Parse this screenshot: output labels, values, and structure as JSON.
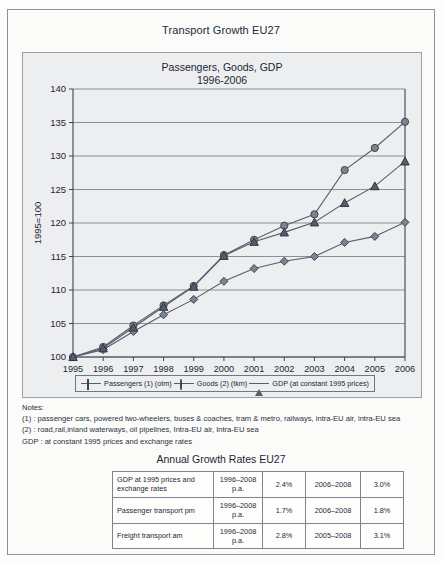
{
  "document": {
    "title": "Transport Growth EU27"
  },
  "chart_panel": {
    "title_line1": "Passengers, Goods, GDP",
    "title_line2": "1996-2006",
    "y_axis_label": "1995=100"
  },
  "chart_data": {
    "type": "line",
    "title": "Passengers, Goods, GDP 1996-2006",
    "xlabel": "",
    "ylabel": "1995=100",
    "ylim": [
      100,
      140
    ],
    "yticks": [
      100,
      105,
      110,
      115,
      120,
      125,
      130,
      135,
      140
    ],
    "grid": true,
    "legend_position": "bottom",
    "x": [
      1995,
      1996,
      1997,
      1998,
      1999,
      2000,
      2001,
      2002,
      2003,
      2004,
      2005,
      2006
    ],
    "categories": [
      "1995",
      "1996",
      "1997",
      "1998",
      "1999",
      "2000",
      "2001",
      "2002",
      "2003",
      "2004",
      "2005",
      "2006"
    ],
    "series": [
      {
        "name": "Passengers (1) (otm)",
        "marker": "diamond",
        "values": [
          100.0,
          101.1,
          103.8,
          106.3,
          108.6,
          111.3,
          113.2,
          114.3,
          115.0,
          117.1,
          118.0,
          120.1
        ]
      },
      {
        "name": "Goods (2) (tkm)",
        "marker": "circle",
        "values": [
          100.0,
          101.5,
          104.7,
          107.7,
          110.6,
          115.2,
          117.5,
          119.6,
          121.3,
          127.9,
          131.2,
          135.1
        ]
      },
      {
        "name": "GDP (at constant 1995 prices)",
        "marker": "triangle",
        "values": [
          100.0,
          101.3,
          104.4,
          107.5,
          110.5,
          115.1,
          117.2,
          118.6,
          120.1,
          123.0,
          125.5,
          129.2
        ]
      }
    ]
  },
  "legend": {
    "items": [
      {
        "label": "Passengers (1) (otm)",
        "marker": "diamond-marker"
      },
      {
        "label": "Goods (2) (tkm)",
        "marker": "circle-marker"
      },
      {
        "label": "GDP (at constant 1995 prices)",
        "marker": "triangle-marker"
      }
    ]
  },
  "notes": {
    "heading": "Notes:",
    "lines": [
      "(1) : passenger cars, powered two-wheelers, buses & coaches, tram & metro, railways, intra-EU air, intra-EU sea",
      "(2) : road,rail,inland waterways, oil pipelines, Intra-EU air, Intra-EU sea",
      "GDP : at constant 1995 prices and exchange rates"
    ]
  },
  "growth_table": {
    "title": "Annual Growth Rates EU27",
    "rows": [
      {
        "label": "GDP at 1995 prices and exchange rates",
        "period1": "1996–2008 p.a.",
        "value1": "2.4%",
        "period2": "2006–2008",
        "value2": "3.0%"
      },
      {
        "label": "Passenger transport pm",
        "period1": "1996–2008 p.a.",
        "value1": "1.7%",
        "period2": "2006–2008",
        "value2": "1.8%"
      },
      {
        "label": "Freight transport am",
        "period1": "1996–2008 p.a.",
        "value1": "2.8%",
        "period2": "2005–2008",
        "value2": "3.1%"
      }
    ]
  },
  "colors": {
    "marker_fill": "#7b8490",
    "marker_stroke": "#3e4550",
    "line": "#565e6b",
    "grid": "#7d848f",
    "panel_bg": "#eceef0",
    "frame": "#8d9099"
  }
}
